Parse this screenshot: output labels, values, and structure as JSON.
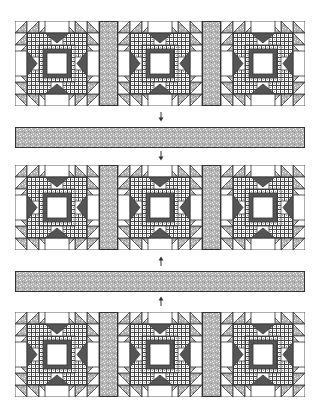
{
  "diagram": {
    "title": "",
    "type": "quilt-assembly",
    "colors": {
      "outline": "#333333",
      "dark": "#555555",
      "light_print": "#bdbdbd",
      "background": "#ffffff"
    },
    "rows": [
      {
        "label": "block-row-1",
        "top": 21,
        "blocks": 3
      },
      {
        "label": "block-row-2",
        "top": 164,
        "blocks": 3
      },
      {
        "label": "block-row-3",
        "top": 312,
        "blocks": 3
      }
    ],
    "strips": [
      {
        "label": "sashing-strip-1",
        "top": 127
      },
      {
        "label": "sashing-strip-2",
        "top": 271
      }
    ],
    "arrows": [
      {
        "label": "arrow-down-1",
        "top": 112,
        "direction": "down"
      },
      {
        "label": "arrow-down-2",
        "top": 150,
        "direction": "down"
      },
      {
        "label": "arrow-up-1",
        "top": 254,
        "direction": "up"
      },
      {
        "label": "arrow-up-2",
        "top": 295,
        "direction": "up"
      }
    ]
  }
}
